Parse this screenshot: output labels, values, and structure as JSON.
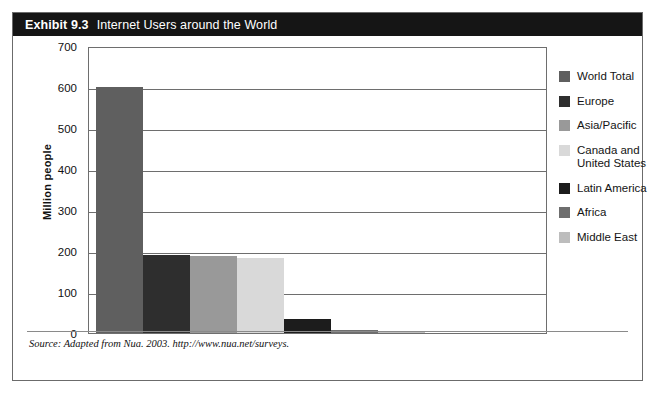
{
  "exhibit": {
    "number": "Exhibit 9.3",
    "title": "Internet Users around the World",
    "source_note": "Source: Adapted from Nua. 2003. http://www.nua.net/surveys."
  },
  "colors": {
    "title_bar_bg": "#151515",
    "frame_border": "#6b6b6b",
    "gridline": "#6e6e6e",
    "text": "#141414",
    "page_bg": "#ffffff"
  },
  "chart_data": {
    "type": "bar",
    "title": "Internet Users around the World",
    "xlabel": "",
    "ylabel": "Million people",
    "ylim": [
      0,
      700
    ],
    "yticks": [
      0,
      100,
      200,
      300,
      400,
      500,
      600,
      700
    ],
    "ytick_labels": [
      "0",
      "100",
      "200",
      "300",
      "400",
      "500",
      "600",
      "700"
    ],
    "grid": true,
    "legend_position": "right",
    "categories": [
      "World Total",
      "Europe",
      "Asia/Pacific",
      "Canada and United States",
      "Latin America",
      "Africa",
      "Middle East"
    ],
    "values": [
      600,
      190,
      187,
      182,
      33,
      7,
      5
    ],
    "bar_colors": [
      "#5f5f5f",
      "#2e2e2e",
      "#999999",
      "#d9d9d9",
      "#1c1c1c",
      "#6e6e6e",
      "#bdbdbd"
    ]
  },
  "legend": {
    "items": [
      {
        "label": "World Total",
        "color": "#5f5f5f"
      },
      {
        "label": "Europe",
        "color": "#2e2e2e"
      },
      {
        "label": "Asia/Pacific",
        "color": "#999999"
      },
      {
        "label": "Canada and\nUnited States",
        "color": "#d9d9d9"
      },
      {
        "label": "Latin America",
        "color": "#1c1c1c"
      },
      {
        "label": "Africa",
        "color": "#6e6e6e"
      },
      {
        "label": "Middle East",
        "color": "#bdbdbd"
      }
    ]
  }
}
